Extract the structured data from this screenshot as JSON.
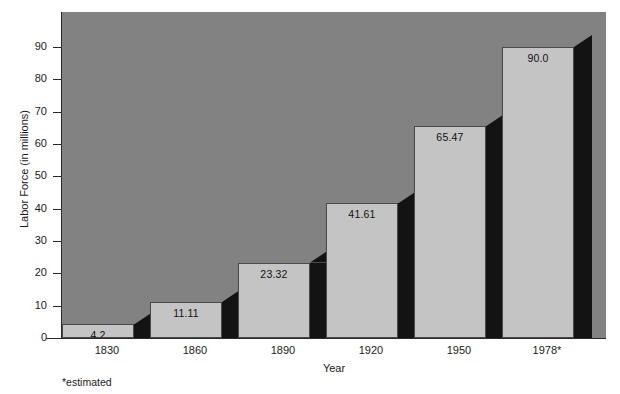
{
  "chart_data": {
    "type": "bar",
    "title": "",
    "subtitle": "",
    "xlabel": "Year",
    "ylabel": "Labor Force (in millions)",
    "categories": [
      "1830",
      "1860",
      "1890",
      "1920",
      "1950",
      "1978*"
    ],
    "values": [
      4.2,
      11.11,
      23.32,
      41.61,
      65.47,
      90.0
    ],
    "value_labels": [
      "4.2",
      "11.11",
      "23.32",
      "41.61",
      "65.47",
      "90.0"
    ],
    "ylim": [
      0,
      100
    ],
    "yticks": [
      0,
      10,
      20,
      30,
      40,
      50,
      60,
      70,
      80,
      90
    ],
    "ytick_labels": [
      "0",
      "10",
      "20",
      "30",
      "40",
      "50",
      "60",
      "70",
      "80",
      "90"
    ],
    "grid": false,
    "legend": null,
    "annotations": [
      "*estimated"
    ],
    "style": {
      "plot_background": "#828282",
      "bar_face_color": "#c4c4c4",
      "bar_side_color": "#131313",
      "bar_edge_color": "#4a4a4a",
      "axis_color": "#2b2b2b",
      "text_color": "#1a1a1a",
      "page_background": "#ffffff"
    }
  },
  "footnote": "*estimated"
}
